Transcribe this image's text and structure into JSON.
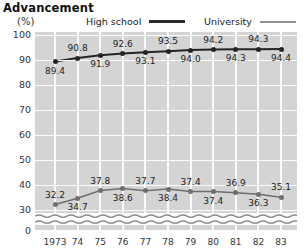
{
  "title": "Advancement",
  "unit_label": "(%)",
  "legend": [
    {
      "label": "High  school",
      "key": "high_school",
      "color": "#242424",
      "style": "thick"
    },
    {
      "label": "University",
      "key": "university",
      "color": "#6e6e6e",
      "style": "thin"
    }
  ],
  "axis": {
    "y_ticks": [
      "100",
      "90",
      "80",
      "70",
      "60",
      "50",
      "40",
      "30",
      "0"
    ],
    "x_ticks": [
      "1973",
      "74",
      "75",
      "76",
      "77",
      "78",
      "79",
      "80",
      "81",
      "82",
      "83"
    ]
  },
  "chart_data": {
    "type": "line",
    "title": "Advancement",
    "xlabel": "",
    "ylabel": "(%)",
    "ylim": [
      30,
      100
    ],
    "y_ticks": [
      100,
      90,
      80,
      70,
      60,
      50,
      40,
      30,
      0
    ],
    "axis_break": true,
    "grid": true,
    "legend_position": "top",
    "categories": [
      "1973",
      "74",
      "75",
      "76",
      "77",
      "78",
      "79",
      "80",
      "81",
      "82",
      "83"
    ],
    "series": [
      {
        "name": "High school",
        "color": "#242424",
        "values": [
          89.4,
          90.8,
          91.9,
          92.6,
          93.1,
          93.5,
          94.0,
          94.2,
          94.3,
          94.3,
          94.4
        ],
        "labels": [
          "89.4",
          "90.8",
          "91.9",
          "92.6",
          "93.1",
          "93.5",
          "94.0",
          "94.2",
          "94.3",
          "94.3",
          "94.4"
        ],
        "label_positions": [
          "below",
          "above",
          "below",
          "above",
          "below",
          "above",
          "below",
          "above",
          "below",
          "above",
          "below"
        ]
      },
      {
        "name": "University",
        "color": "#6e6e6e",
        "values": [
          32.2,
          34.7,
          37.8,
          38.6,
          37.7,
          38.4,
          37.4,
          37.4,
          36.9,
          36.3,
          35.1
        ],
        "labels": [
          "32.2",
          "34.7",
          "37.8",
          "38.6",
          "37.7",
          "38.4",
          "37.4",
          "37.4",
          "36.9",
          "36.3",
          "35.1"
        ],
        "label_positions": [
          "above",
          "below",
          "above",
          "below",
          "above",
          "below",
          "above",
          "below",
          "above",
          "below",
          "above"
        ]
      }
    ]
  }
}
